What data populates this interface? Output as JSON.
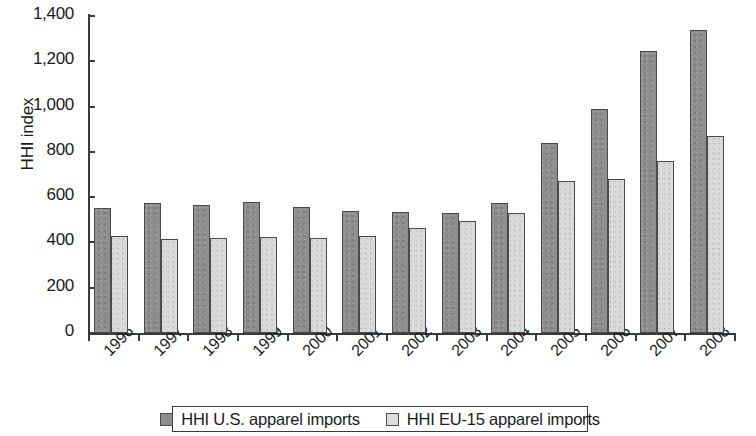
{
  "chart_data": {
    "type": "bar",
    "title": "",
    "xlabel": "",
    "ylabel": "HHI index",
    "ylim": [
      0,
      1400
    ],
    "ytick_values": [
      0,
      200,
      400,
      600,
      800,
      1000,
      1200,
      1400
    ],
    "ytick_labels": [
      "0",
      "200",
      "400",
      "600",
      "800",
      "1,000",
      "1,200",
      "1,400"
    ],
    "grid": false,
    "legend_position": "bottom",
    "categories": [
      "1996",
      "1997",
      "1998",
      "1999",
      "2000",
      "2001",
      "2002",
      "2003",
      "2004",
      "2005",
      "2006",
      "2007",
      "2008"
    ],
    "series": [
      {
        "name": "HHI U.S. apparel imports",
        "color": "#8e8e8e",
        "values": [
          550,
          572,
          565,
          580,
          556,
          540,
          536,
          530,
          572,
          838,
          988,
          1245,
          1338
        ]
      },
      {
        "name": "HHI EU-15 apparel imports",
        "color": "#dcdcdc",
        "values": [
          428,
          415,
          420,
          424,
          418,
          427,
          464,
          496,
          530,
          672,
          680,
          760,
          868
        ]
      }
    ]
  },
  "legend": {
    "items": [
      {
        "label": "HHI U.S. apparel imports",
        "swatch": "us"
      },
      {
        "label": "HHI EU-15 apparel imports",
        "swatch": "eu"
      }
    ]
  }
}
